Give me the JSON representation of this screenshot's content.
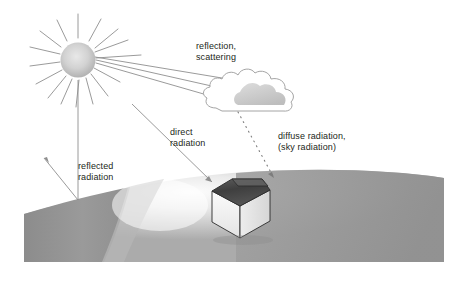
{
  "figure": {
    "background_color": "#ffffff"
  },
  "labels": {
    "reflection_scattering": {
      "line1": "reflection,",
      "line2": "scattering"
    },
    "direct_radiation": {
      "line1": "direct",
      "line2": "radiation"
    },
    "diffuse_radiation": {
      "line1": "diffuse radiation,",
      "line2": "(sky radiation)"
    },
    "reflected_radiation": {
      "line1": "reflected",
      "line2": "radiation"
    }
  },
  "elements": {
    "sun": {
      "name": "sun",
      "cx": 78,
      "cy": 60,
      "r": 17,
      "fill_center": "#e4e4e4",
      "fill_edge": "#b4b4b4"
    },
    "cloud": {
      "name": "cloud",
      "outline_color": "#9a9a9a",
      "fill": "#ffffff",
      "shadow_fill": "#bdbdbd"
    },
    "house": {
      "name": "house-with-solar-roof",
      "wall_fill": "#f0f0f0",
      "roof_fill": "#4a4a4a",
      "outline": "#2b2b2b"
    },
    "ground": {
      "name": "curved-earth-surface",
      "light_fill": "#f2f2f2",
      "mid_fill": "#9c9c9c",
      "dark_fill": "#8a8a8a"
    },
    "rays": {
      "name": "sun-rays",
      "color": "#8c8c8c"
    },
    "dotted_ray": {
      "name": "diffuse-radiation-dotted-ray",
      "color": "#7d7d7d",
      "style": "dotted"
    }
  },
  "colors": {
    "text": "#231f20",
    "line": "#8c8c8c",
    "accent_dark": "#4a4a4a"
  }
}
